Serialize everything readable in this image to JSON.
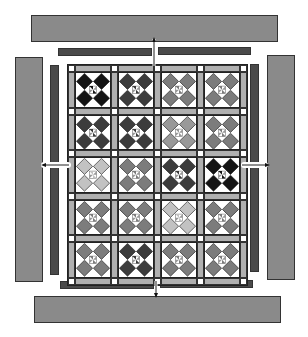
{
  "diagram": {
    "type": "quilt-assembly",
    "grid": {
      "rows": 5,
      "cols": 4
    },
    "shades": {
      "black": "#141414",
      "dark": "#3c3c3c",
      "medium": "#7c7c7c",
      "lightmedium": "#999999",
      "light": "#c2c2c2"
    },
    "blocks": [
      [
        "black",
        "dark",
        "medium",
        "medium"
      ],
      [
        "dark",
        "dark",
        "lightmedium",
        "medium"
      ],
      [
        "light",
        "medium",
        "dark",
        "black"
      ],
      [
        "medium",
        "medium",
        "light",
        "medium"
      ],
      [
        "medium",
        "dark",
        "medium",
        "medium"
      ]
    ],
    "colors": {
      "outer_border": "#8a8a8a",
      "inner_border": "#4a4a4a",
      "sashing": "#b0b0b0",
      "cornerstone": "#ffffff",
      "background": "#ffffff"
    },
    "arrows": [
      "up",
      "down",
      "left",
      "right"
    ]
  }
}
